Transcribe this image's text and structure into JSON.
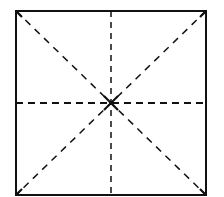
{
  "diagram": {
    "type": "square-with-fold-lines",
    "square": {
      "x": 16,
      "y": 11,
      "size": 190,
      "stroke": "#111111",
      "stroke_width": 2
    },
    "fold_lines": [
      {
        "name": "vertical-midline",
        "style": "dashed"
      },
      {
        "name": "horizontal-midline",
        "style": "dashed"
      },
      {
        "name": "diagonal-top-left-to-bottom-right",
        "style": "dashed"
      },
      {
        "name": "diagonal-top-right-to-bottom-left",
        "style": "dashed"
      }
    ],
    "center_mark": "solid-cross"
  }
}
